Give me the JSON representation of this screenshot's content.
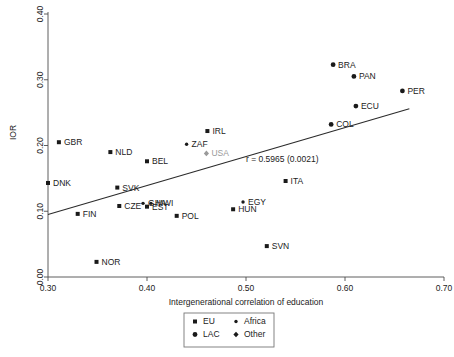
{
  "chart_data": {
    "type": "scatter",
    "title": "",
    "xlabel": "Intergenerational correlation of education",
    "ylabel": "IOR",
    "xlim": [
      0.3,
      0.7
    ],
    "ylim": [
      0.0,
      0.4
    ],
    "xticks": [
      "0.30",
      "0.40",
      "0.50",
      "0.60",
      "0.70"
    ],
    "xtick_values": [
      0.3,
      0.4,
      0.5,
      0.6,
      0.7
    ],
    "yticks": [
      "0.00",
      "0.10",
      "0.20",
      "0.30",
      "0.40"
    ],
    "ytick_values": [
      0.0,
      0.1,
      0.2,
      0.3,
      0.4
    ],
    "grid": false,
    "annotation": "r =  0.5965  (0.0021)",
    "trendline": {
      "x0": 0.3,
      "y0": 0.095,
      "x1": 0.665,
      "y1": 0.256
    },
    "points": [
      {
        "label": "DNK",
        "x": 0.3,
        "y": 0.143,
        "group": "EU",
        "label_pos": "right"
      },
      {
        "label": "GBR",
        "x": 0.311,
        "y": 0.205,
        "group": "EU",
        "label_pos": "right"
      },
      {
        "label": "FIN",
        "x": 0.33,
        "y": 0.096,
        "group": "EU",
        "label_pos": "right"
      },
      {
        "label": "NOR",
        "x": 0.349,
        "y": 0.023,
        "group": "EU",
        "label_pos": "right"
      },
      {
        "label": "NLD",
        "x": 0.363,
        "y": 0.19,
        "group": "EU",
        "label_pos": "right"
      },
      {
        "label": "SVK",
        "x": 0.37,
        "y": 0.136,
        "group": "EU",
        "label_pos": "right"
      },
      {
        "label": "CZE",
        "x": 0.372,
        "y": 0.108,
        "group": "EU",
        "label_pos": "right"
      },
      {
        "label": "BEL",
        "x": 0.4,
        "y": 0.176,
        "group": "EU",
        "label_pos": "right"
      },
      {
        "label": "EST",
        "x": 0.4,
        "y": 0.107,
        "group": "EU",
        "label_pos": "right"
      },
      {
        "label": "GHA",
        "x": 0.396,
        "y": 0.112,
        "group": "Africa",
        "label_pos": "right"
      },
      {
        "label": "MWI",
        "x": 0.404,
        "y": 0.112,
        "group": "Africa",
        "label_pos": "right"
      },
      {
        "label": "POL",
        "x": 0.43,
        "y": 0.093,
        "group": "EU",
        "label_pos": "right"
      },
      {
        "label": "ZAF",
        "x": 0.44,
        "y": 0.202,
        "group": "Africa",
        "label_pos": "right"
      },
      {
        "label": "IRL",
        "x": 0.461,
        "y": 0.222,
        "group": "EU",
        "label_pos": "right"
      },
      {
        "label": "USA",
        "x": 0.46,
        "y": 0.188,
        "group": "Other",
        "label_pos": "right",
        "muted": true
      },
      {
        "label": "HUN",
        "x": 0.487,
        "y": 0.103,
        "group": "EU",
        "label_pos": "right"
      },
      {
        "label": "EGY",
        "x": 0.497,
        "y": 0.114,
        "group": "Africa",
        "label_pos": "right"
      },
      {
        "label": "SVN",
        "x": 0.521,
        "y": 0.047,
        "group": "EU",
        "label_pos": "right"
      },
      {
        "label": "ITA",
        "x": 0.54,
        "y": 0.146,
        "group": "EU",
        "label_pos": "right"
      },
      {
        "label": "COL",
        "x": 0.586,
        "y": 0.232,
        "group": "LAC",
        "label_pos": "right"
      },
      {
        "label": "BRA",
        "x": 0.588,
        "y": 0.323,
        "group": "LAC",
        "label_pos": "right"
      },
      {
        "label": "PAN",
        "x": 0.609,
        "y": 0.305,
        "group": "LAC",
        "label_pos": "right"
      },
      {
        "label": "ECU",
        "x": 0.611,
        "y": 0.26,
        "group": "LAC",
        "label_pos": "right"
      },
      {
        "label": "PER",
        "x": 0.658,
        "y": 0.283,
        "group": "LAC",
        "label_pos": "right"
      }
    ],
    "legend": {
      "position": "bottom-center",
      "entries": [
        {
          "label": "EU",
          "marker": "square"
        },
        {
          "label": "Africa",
          "marker": "dot"
        },
        {
          "label": "LAC",
          "marker": "circle"
        },
        {
          "label": "Other",
          "marker": "diamond"
        }
      ]
    }
  }
}
